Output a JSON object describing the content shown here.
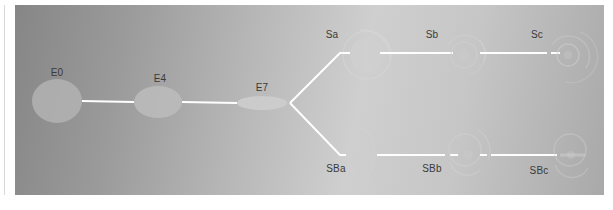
{
  "diagram": {
    "type": "lineage-tree",
    "colors": {
      "line": "#ffffff",
      "node_fill": "#b5b5b5",
      "label": "#3a3a3a",
      "bg_dark": "#868686",
      "bg_light": "#cfcfcf"
    },
    "nodes": [
      {
        "id": "E0",
        "label": "E0",
        "x": 57,
        "y": 101
      },
      {
        "id": "E4",
        "label": "E4",
        "x": 158,
        "y": 102
      },
      {
        "id": "E7",
        "label": "E7",
        "x": 262,
        "y": 103
      },
      {
        "id": "Sa",
        "label": "Sa",
        "x": 363,
        "y": 53
      },
      {
        "id": "Sb",
        "label": "Sb",
        "x": 463,
        "y": 53
      },
      {
        "id": "Sc",
        "label": "Sc",
        "x": 568,
        "y": 53
      },
      {
        "id": "SBa",
        "label": "SBa",
        "x": 362,
        "y": 155
      },
      {
        "id": "SBb",
        "label": "SBb",
        "x": 465,
        "y": 155
      },
      {
        "id": "SBc",
        "label": "SBc",
        "x": 570,
        "y": 155
      }
    ],
    "edges": [
      [
        "E0",
        "E4"
      ],
      [
        "E4",
        "E7"
      ],
      [
        "E7",
        "Sa"
      ],
      [
        "E7",
        "SBa"
      ],
      [
        "Sa",
        "Sb"
      ],
      [
        "Sb",
        "Sc"
      ],
      [
        "SBa",
        "SBb"
      ],
      [
        "SBb",
        "SBc"
      ]
    ],
    "labels": {
      "E0": "E0",
      "E4": "E4",
      "E7": "E7",
      "Sa": "Sa",
      "Sb": "Sb",
      "Sc": "Sc",
      "SBa": "SBa",
      "SBb": "SBb",
      "SBc": "SBc"
    }
  }
}
